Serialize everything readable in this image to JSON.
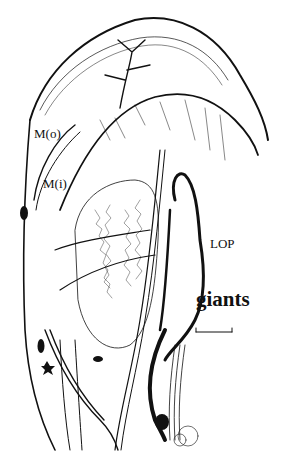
{
  "figure": {
    "type": "neuron anatomical drawing",
    "labels": {
      "mo": "M(o)",
      "mi": "M(i)",
      "lop": "LOP",
      "giants": "giants"
    },
    "scale_bar": true,
    "colors": {
      "ink": "#111111",
      "background": "#ffffff"
    }
  }
}
